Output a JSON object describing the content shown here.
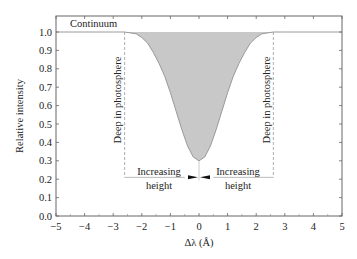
{
  "chart_data": {
    "type": "area",
    "title": "",
    "xlabel": "Δλ (Å)",
    "ylabel": "Relative intensity",
    "xlim": [
      -5,
      5
    ],
    "ylim": [
      0.0,
      1.05
    ],
    "x_ticks": [
      "−5",
      "−4",
      "−3",
      "−2",
      "−1",
      "0",
      "1",
      "2",
      "3",
      "4",
      "5"
    ],
    "y_ticks": [
      "0.0",
      "0.1",
      "0.2",
      "0.3",
      "0.4",
      "0.5",
      "0.6",
      "0.7",
      "0.8",
      "0.9",
      "1.0"
    ],
    "grid": false,
    "legend": null,
    "series": [
      {
        "name": "Absorption line profile",
        "x": [
          -5,
          -3,
          -2.6,
          -2.2,
          -2.0,
          -1.8,
          -1.6,
          -1.4,
          -1.2,
          -1.0,
          -0.8,
          -0.6,
          -0.4,
          -0.2,
          0.0,
          0.2,
          0.4,
          0.6,
          0.8,
          1.0,
          1.2,
          1.4,
          1.6,
          1.8,
          2.0,
          2.2,
          2.6,
          3,
          5
        ],
        "y": [
          1.0,
          1.0,
          1.0,
          0.99,
          0.97,
          0.94,
          0.89,
          0.83,
          0.76,
          0.67,
          0.57,
          0.47,
          0.38,
          0.32,
          0.3,
          0.32,
          0.38,
          0.47,
          0.57,
          0.67,
          0.76,
          0.83,
          0.89,
          0.94,
          0.97,
          0.99,
          1.0,
          1.0,
          1.0
        ],
        "fill": "#c8c8c8",
        "line_color": "#9a9a9a"
      }
    ],
    "annotations": [
      {
        "text": "Continuum",
        "x": -4.4,
        "y": 1.02
      },
      {
        "text": "Deep in photosphere",
        "x": -2.6,
        "y": 0.6,
        "rotation": -90
      },
      {
        "text": "Deep in photosphere",
        "x": 2.6,
        "y": 0.6,
        "rotation": -90
      },
      {
        "text": "Increasing height",
        "x": -1.3,
        "y": 0.2,
        "lines": [
          "Increasing",
          "height"
        ]
      },
      {
        "text": "Increasing height",
        "x": 1.3,
        "y": 0.2,
        "lines": [
          "Increasing",
          "height"
        ]
      }
    ],
    "markers": {
      "dashed_verticals_x": [
        -2.6,
        2.6
      ],
      "dashed_vertical_y_range": [
        0.21,
        1.0
      ],
      "height_baseline_y": 0.21,
      "center_arrows_x": 0
    },
    "colors": {
      "fill": "#c8c8c8",
      "axis": "#555555",
      "text": "#222222",
      "dashed": "#999999"
    }
  }
}
